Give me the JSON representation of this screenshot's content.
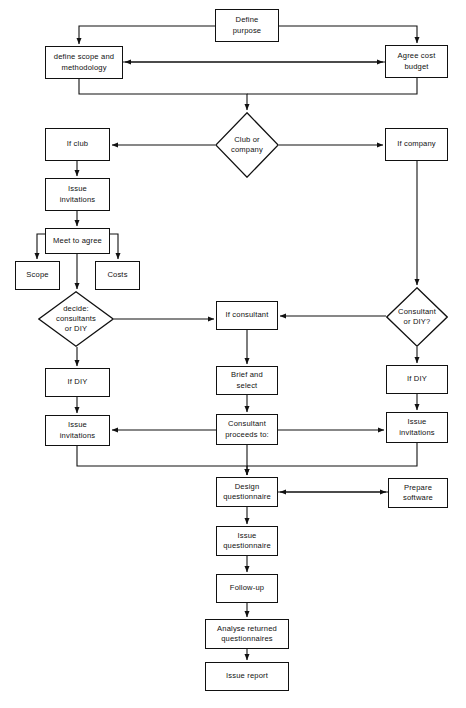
{
  "diagram": {
    "stroke_color": "#111111",
    "background_color": "#ffffff",
    "width": 466,
    "height": 708,
    "nodes": [
      {
        "id": "define_purpose",
        "label": "Define\npurpose",
        "shape": "box",
        "x": 215,
        "y": 9,
        "w": 64,
        "h": 33
      },
      {
        "id": "define_scope",
        "label": "define scope and\nmethodology",
        "shape": "box",
        "x": 45,
        "y": 46,
        "w": 78,
        "h": 33
      },
      {
        "id": "agree_cost",
        "label": "Agree cost\nbudget",
        "shape": "box",
        "x": 385,
        "y": 45,
        "w": 63,
        "h": 33
      },
      {
        "id": "club_or_company",
        "label": "Club or\ncompany",
        "shape": "diamond",
        "x": 215,
        "y": 112,
        "w": 64,
        "h": 66
      },
      {
        "id": "if_club",
        "label": "If club",
        "shape": "box",
        "x": 45,
        "y": 128,
        "w": 65,
        "h": 33
      },
      {
        "id": "if_company",
        "label": "If company",
        "shape": "box",
        "x": 385,
        "y": 128,
        "w": 63,
        "h": 33
      },
      {
        "id": "issue_invitations_1",
        "label": "Issue\ninvitations",
        "shape": "box",
        "x": 45,
        "y": 178,
        "w": 65,
        "h": 33
      },
      {
        "id": "meet_to_agree",
        "label": "Meet to agree",
        "shape": "box",
        "x": 45,
        "y": 228,
        "w": 65,
        "h": 26
      },
      {
        "id": "scope",
        "label": "Scope",
        "shape": "box",
        "x": 15,
        "y": 261,
        "w": 45,
        "h": 29
      },
      {
        "id": "costs",
        "label": "Costs",
        "shape": "box",
        "x": 95,
        "y": 261,
        "w": 45,
        "h": 29
      },
      {
        "id": "decide_consult_diy",
        "label": "decide:\nconsultants\nor DIY",
        "shape": "diamond",
        "x": 38,
        "y": 291,
        "w": 76,
        "h": 56
      },
      {
        "id": "if_consultant",
        "label": "If consultant",
        "shape": "box",
        "x": 216,
        "y": 301,
        "w": 62,
        "h": 29
      },
      {
        "id": "consultant_or_diy",
        "label": "Consultant\nor DIY?",
        "shape": "diamond",
        "x": 386,
        "y": 287,
        "w": 62,
        "h": 60
      },
      {
        "id": "brief_and_select",
        "label": "Brief and\nselect",
        "shape": "box",
        "x": 216,
        "y": 366,
        "w": 62,
        "h": 29
      },
      {
        "id": "if_diy_left",
        "label": "If DIY",
        "shape": "box",
        "x": 45,
        "y": 368,
        "w": 65,
        "h": 29
      },
      {
        "id": "if_diy_right",
        "label": "If DIY",
        "shape": "box",
        "x": 386,
        "y": 365,
        "w": 62,
        "h": 29
      },
      {
        "id": "issue_invitations_2",
        "label": "Issue\ninvitations",
        "shape": "box",
        "x": 45,
        "y": 415,
        "w": 65,
        "h": 31
      },
      {
        "id": "consultant_proceeds",
        "label": "Consultant\nproceeds to:",
        "shape": "box",
        "x": 216,
        "y": 414,
        "w": 62,
        "h": 31
      },
      {
        "id": "issue_invitations_3",
        "label": "Issue\ninvitations",
        "shape": "box",
        "x": 386,
        "y": 412,
        "w": 62,
        "h": 31
      },
      {
        "id": "design_questionnaire",
        "label": "Design\nquestionnaire",
        "shape": "box",
        "x": 216,
        "y": 477,
        "w": 62,
        "h": 30
      },
      {
        "id": "prepare_software",
        "label": "Prepare\nsoftware",
        "shape": "box",
        "x": 388,
        "y": 478,
        "w": 60,
        "h": 30
      },
      {
        "id": "issue_questionnaire",
        "label": "Issue\nquestionnaire",
        "shape": "box",
        "x": 216,
        "y": 526,
        "w": 62,
        "h": 30
      },
      {
        "id": "follow_up",
        "label": "Follow-up",
        "shape": "box",
        "x": 216,
        "y": 574,
        "w": 62,
        "h": 29
      },
      {
        "id": "analyse_returned",
        "label": "Analyse returned\nquestionnaires",
        "shape": "box",
        "x": 205,
        "y": 619,
        "w": 84,
        "h": 30
      },
      {
        "id": "issue_report",
        "label": "Issue report",
        "shape": "box",
        "x": 205,
        "y": 662,
        "w": 84,
        "h": 29
      }
    ],
    "connectors": [
      {
        "id": "c-purpose-to-scope",
        "from": "define_purpose",
        "to": "define_scope",
        "path": "M 215 26 L 79 26 L 79 44",
        "arrow_at": "end"
      },
      {
        "id": "c-purpose-to-budget",
        "from": "define_purpose",
        "to": "agree_cost",
        "path": "M 279 26 L 417 26 L 417 43",
        "arrow_at": "end"
      },
      {
        "id": "c-budget-to-scope",
        "from": "agree_cost",
        "to": "define_scope",
        "path": "M 385 62 L 125 62",
        "arrow_at": "end"
      },
      {
        "id": "c-scope-to-budget",
        "from": "define_scope",
        "to": "agree_cost",
        "path": "M 123 62 L 383 62",
        "arrow_at": "end"
      },
      {
        "id": "c-scope-to-club",
        "from": "define_scope",
        "to": "club_or_company",
        "path": "M 79 79 L 79 94 L 247 94 L 247 110",
        "arrow_at": "end"
      },
      {
        "id": "c-budget-to-club",
        "from": "agree_cost",
        "to": "club_or_company",
        "path": "M 417 78 L 417 94 L 247 94",
        "arrow_at": "none"
      },
      {
        "id": "c-club-to-ifclub",
        "from": "club_or_company",
        "to": "if_club",
        "path": "M 215 145 L 112 145",
        "arrow_at": "end"
      },
      {
        "id": "c-club-to-ifcompany",
        "from": "club_or_company",
        "to": "if_company",
        "path": "M 279 145 L 383 145",
        "arrow_at": "end"
      },
      {
        "id": "c-ifclub-to-invites",
        "from": "if_club",
        "to": "issue_invitations_1",
        "path": "M 77 161 L 77 176",
        "arrow_at": "end"
      },
      {
        "id": "c-invites-to-meet",
        "from": "issue_invitations_1",
        "to": "meet_to_agree",
        "path": "M 77 211 L 77 226",
        "arrow_at": "end"
      },
      {
        "id": "c-meet-to-scope",
        "from": "meet_to_agree",
        "to": "scope",
        "path": "M 52 234 L 37 234 L 37 259",
        "arrow_at": "end"
      },
      {
        "id": "c-meet-to-costs",
        "from": "meet_to_agree",
        "to": "costs",
        "path": "M 103 234 L 118 234 L 118 259",
        "arrow_at": "end"
      },
      {
        "id": "c-meet-to-decide",
        "from": "meet_to_agree",
        "to": "decide_consult_diy",
        "path": "M 77 254 L 77 289",
        "arrow_at": "end"
      },
      {
        "id": "c-decide-to-consultant",
        "from": "decide_consult_diy",
        "to": "if_consultant",
        "path": "M 114 319 L 214 319",
        "arrow_at": "end"
      },
      {
        "id": "c-decide-to-ifdiy",
        "from": "decide_consult_diy",
        "to": "if_diy_left",
        "path": "M 77 347 L 77 366",
        "arrow_at": "end"
      },
      {
        "id": "c-ifcompany-to-consdiy",
        "from": "if_company",
        "to": "consultant_or_diy",
        "path": "M 417 161 L 417 285",
        "arrow_at": "end"
      },
      {
        "id": "c-consdiy-to-consultant",
        "from": "consultant_or_diy",
        "to": "if_consultant",
        "path": "M 386 316 L 280 316",
        "arrow_at": "end"
      },
      {
        "id": "c-consdiy-to-ifdiy",
        "from": "consultant_or_diy",
        "to": "if_diy_right",
        "path": "M 417 347 L 417 363",
        "arrow_at": "end"
      },
      {
        "id": "c-consultant-to-brief",
        "from": "if_consultant",
        "to": "brief_and_select",
        "path": "M 247 330 L 247 364",
        "arrow_at": "end"
      },
      {
        "id": "c-brief-to-proceeds",
        "from": "brief_and_select",
        "to": "consultant_proceeds",
        "path": "M 247 395 L 247 412",
        "arrow_at": "end"
      },
      {
        "id": "c-ifdiyleft-to-invites2",
        "from": "if_diy_left",
        "to": "issue_invitations_2",
        "path": "M 77 397 L 77 413",
        "arrow_at": "end"
      },
      {
        "id": "c-ifdiyright-to-invites3",
        "from": "if_diy_right",
        "to": "issue_invitations_3",
        "path": "M 417 394 L 417 410",
        "arrow_at": "end"
      },
      {
        "id": "c-proceeds-to-invites2",
        "from": "consultant_proceeds",
        "to": "issue_invitations_2",
        "path": "M 216 430 L 112 430",
        "arrow_at": "end"
      },
      {
        "id": "c-proceeds-to-invites3",
        "from": "consultant_proceeds",
        "to": "issue_invitations_3",
        "path": "M 278 430 L 384 430",
        "arrow_at": "end"
      },
      {
        "id": "c-invites2-to-design",
        "from": "issue_invitations_2",
        "to": "design_questionnaire",
        "path": "M 77 446 L 77 466 L 247 466 L 247 475",
        "arrow_at": "end"
      },
      {
        "id": "c-invites3-to-design",
        "from": "issue_invitations_3",
        "to": "design_questionnaire",
        "path": "M 417 443 L 417 466 L 247 466",
        "arrow_at": "none"
      },
      {
        "id": "c-proceeds-to-design",
        "from": "consultant_proceeds",
        "to": "design_questionnaire",
        "path": "M 247 445 L 247 475",
        "arrow_at": "end"
      },
      {
        "id": "c-software-to-design",
        "from": "prepare_software",
        "to": "design_questionnaire",
        "path": "M 388 492 L 280 492",
        "arrow_at": "end"
      },
      {
        "id": "c-design-to-software",
        "from": "design_questionnaire",
        "to": "prepare_software",
        "path": "M 278 492 L 386 492",
        "arrow_at": "end"
      },
      {
        "id": "c-design-to-issueq",
        "from": "design_questionnaire",
        "to": "issue_questionnaire",
        "path": "M 247 507 L 247 524",
        "arrow_at": "end"
      },
      {
        "id": "c-issueq-to-followup",
        "from": "issue_questionnaire",
        "to": "follow_up",
        "path": "M 247 556 L 247 572",
        "arrow_at": "end"
      },
      {
        "id": "c-followup-to-analyse",
        "from": "follow_up",
        "to": "analyse_returned",
        "path": "M 247 603 L 247 617",
        "arrow_at": "end"
      },
      {
        "id": "c-analyse-to-report",
        "from": "analyse_returned",
        "to": "issue_report",
        "path": "M 247 649 L 247 660",
        "arrow_at": "end"
      }
    ]
  }
}
